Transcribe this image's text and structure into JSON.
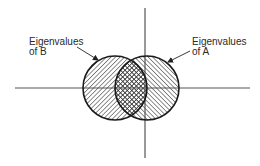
{
  "diagram": {
    "type": "venn-on-complex-plane",
    "axes": {
      "horizontal": {
        "x1": 15,
        "x2": 250,
        "y": 88
      },
      "vertical": {
        "x": 145,
        "y1": 8,
        "y2": 158
      },
      "color": "#555555"
    },
    "sets": [
      {
        "id": "B",
        "label_line1": "Eigenvalues",
        "label_line2": "of B",
        "center": [
          115,
          88
        ],
        "radius": 32,
        "hatch": "backslash",
        "arrow": {
          "from": [
            77,
            47
          ],
          "to": [
            98,
            60
          ]
        }
      },
      {
        "id": "A",
        "label_line1": "Eigenvalues",
        "label_line2": "of A",
        "center": [
          147,
          88
        ],
        "radius": 32,
        "hatch": "slash",
        "arrow": {
          "from": [
            190,
            51
          ],
          "to": [
            168,
            62
          ]
        }
      }
    ],
    "intersection": {
      "hatch": "crosshatch"
    },
    "colors": {
      "stroke": "#1a1a1a",
      "hatch": "#333333",
      "background": "#ffffff"
    }
  }
}
